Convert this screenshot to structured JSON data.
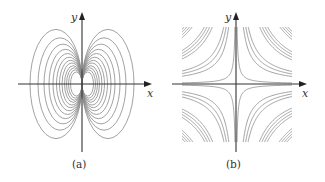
{
  "figure": {
    "panels": [
      {
        "id": "a",
        "caption": "(a)",
        "x_axis_label": "x",
        "y_axis_label": "y",
        "description": "Family of closed loops (dipole-like field lines) tangent to the y-axis at the origin, symmetric on both sides"
      },
      {
        "id": "b",
        "caption": "(b)",
        "x_axis_label": "x",
        "y_axis_label": "y",
        "description": "Family of hyperbolas xy = c in all four quadrants, clipped to a square region"
      }
    ],
    "colors": {
      "curve": "#8a8a8a",
      "axis": "#333333",
      "background": "#ffffff"
    }
  }
}
